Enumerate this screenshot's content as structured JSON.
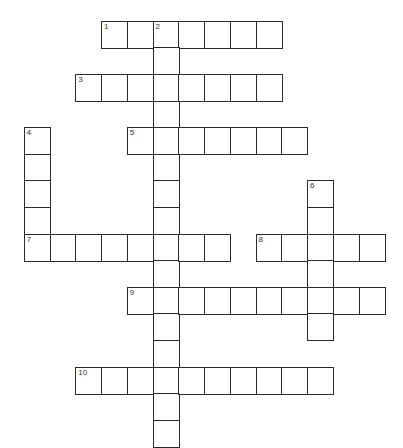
{
  "puzzle": {
    "type": "crossword",
    "grid_columns": 14,
    "grid_rows": 16,
    "entries": [
      {
        "number": "1",
        "direction": "across",
        "col": 3,
        "row": 0,
        "length": 7
      },
      {
        "number": "2",
        "direction": "down",
        "col": 5,
        "row": 0,
        "length": 16
      },
      {
        "number": "3",
        "direction": "across",
        "col": 2,
        "row": 2,
        "length": 8
      },
      {
        "number": "4",
        "direction": "down",
        "col": 0,
        "row": 4,
        "length": 5
      },
      {
        "number": "5",
        "direction": "across",
        "col": 4,
        "row": 4,
        "length": 7
      },
      {
        "number": "6",
        "direction": "down",
        "col": 11,
        "row": 6,
        "length": 6
      },
      {
        "number": "7",
        "direction": "across",
        "col": 0,
        "row": 8,
        "length": 8
      },
      {
        "number": "8",
        "direction": "across",
        "col": 9,
        "row": 8,
        "length": 5
      },
      {
        "number": "9",
        "direction": "across",
        "col": 4,
        "row": 10,
        "length": 10
      },
      {
        "number": "10",
        "direction": "across",
        "col": 2,
        "row": 13,
        "length": 10
      }
    ]
  }
}
